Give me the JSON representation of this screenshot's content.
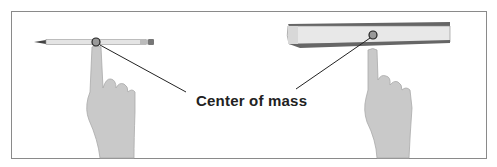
{
  "diagram": {
    "label": "Center of mass",
    "objects": [
      {
        "name": "pencil",
        "balanced_on": "finger"
      },
      {
        "name": "book",
        "balanced_on": "finger"
      }
    ],
    "colors": {
      "frame": "#8a8a8a",
      "marker_fill": "#9a9a9a",
      "marker_stroke": "#222222",
      "leader_line": "#222222"
    }
  }
}
